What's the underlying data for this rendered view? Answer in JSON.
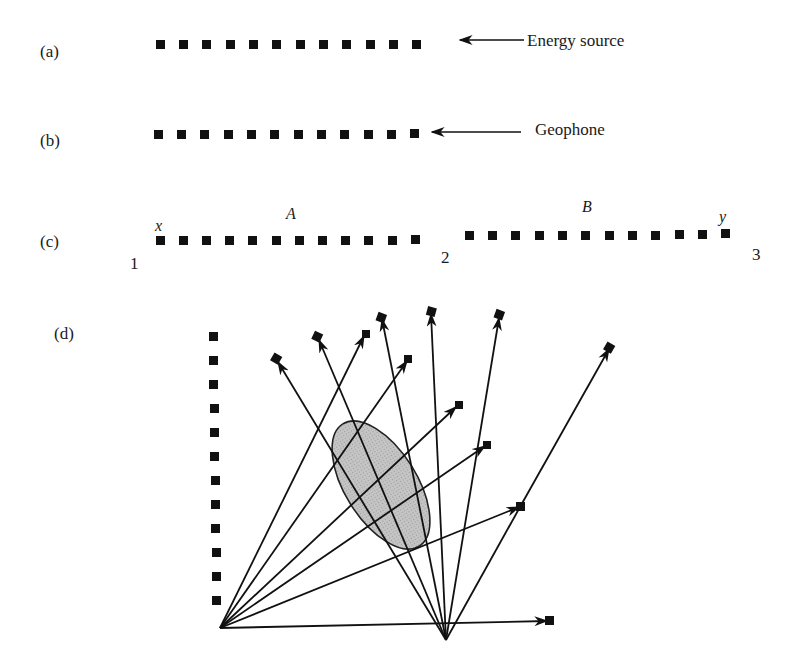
{
  "figure": {
    "panels": [
      {
        "id": "a",
        "label": "(a)",
        "annotation": "Energy source"
      },
      {
        "id": "b",
        "label": "(b)",
        "annotation": "Geophone"
      },
      {
        "id": "c",
        "label": "(c)",
        "segment_labels": [
          "A",
          "B"
        ],
        "end_labels": [
          "x",
          "y"
        ],
        "source_numbers": [
          "1",
          "2",
          "3"
        ]
      },
      {
        "id": "d",
        "label": "(d)",
        "description": "Cross-hole ray paths from two sources through shaded anomaly to receivers"
      }
    ],
    "colors": {
      "ink": "#111111",
      "anomaly_fill": "#bdbdbd",
      "background": "#ffffff"
    }
  }
}
